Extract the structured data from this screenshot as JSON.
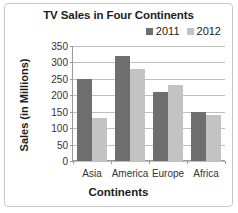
{
  "chart_data": {
    "type": "bar",
    "title": "TV Sales in Four Continents",
    "xlabel": "Continents",
    "ylabel": "Sales (in Millions)",
    "categories": [
      "Asia",
      "America",
      "Europe",
      "Africa"
    ],
    "series": [
      {
        "name": "2011",
        "values": [
          250,
          320,
          210,
          150
        ],
        "color": "#6e6e6e"
      },
      {
        "name": "2012",
        "values": [
          130,
          280,
          230,
          140
        ],
        "color": "#c3c3c3"
      }
    ],
    "ylim": [
      0,
      350
    ],
    "ytick_step": 50,
    "yticks": [
      0,
      50,
      100,
      150,
      200,
      250,
      300,
      350
    ],
    "ytick_labels": [
      "0",
      "50",
      "100",
      "150",
      "200",
      "250",
      "300",
      "350"
    ],
    "grid": true,
    "grid_axis": "y",
    "legend_position": "top-right",
    "legend_entries": [
      "2011",
      "2012"
    ],
    "frame_border_color": "#c9c9c9",
    "gridline_color": "#bfbfbf",
    "axis_color": "#9a9a9a",
    "background": "#ffffff"
  }
}
